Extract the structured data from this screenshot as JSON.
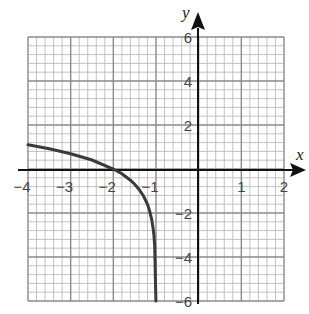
{
  "chart_data": {
    "type": "line",
    "title": "",
    "xlabel": "x",
    "ylabel": "y",
    "xlim": [
      -4,
      2
    ],
    "ylim": [
      -6,
      6
    ],
    "grid": true,
    "grid_minor_step_x": 0.2,
    "grid_minor_step_y": 0.4,
    "x_ticks": [
      -4,
      -3,
      -2,
      -1,
      1,
      2
    ],
    "x_tick_labels": [
      "−4",
      "−3",
      "−2",
      "−1",
      "1",
      "2"
    ],
    "y_ticks": [
      6,
      4,
      2,
      -2,
      -4,
      -6
    ],
    "y_tick_labels": [
      "6",
      "4",
      "2",
      "−2",
      "−4",
      "−6"
    ],
    "series": [
      {
        "name": "curve",
        "description": "y = ln(−x − 1), vertical asymptote at x = −1",
        "x": [
          -4.0,
          -3.5,
          -3.0,
          -2.5,
          -2.0,
          -1.8,
          -1.6,
          -1.5,
          -1.4,
          -1.3,
          -1.2,
          -1.15,
          -1.1,
          -1.07,
          -1.05,
          -1.03,
          -1.0025
        ],
        "y": [
          1.1,
          0.92,
          0.69,
          0.41,
          0.0,
          -0.22,
          -0.51,
          -0.69,
          -0.92,
          -1.2,
          -1.61,
          -1.9,
          -2.3,
          -2.66,
          -3.0,
          -3.51,
          -6.0
        ]
      }
    ]
  },
  "axes": {
    "x_name": "x",
    "y_name": "y"
  }
}
